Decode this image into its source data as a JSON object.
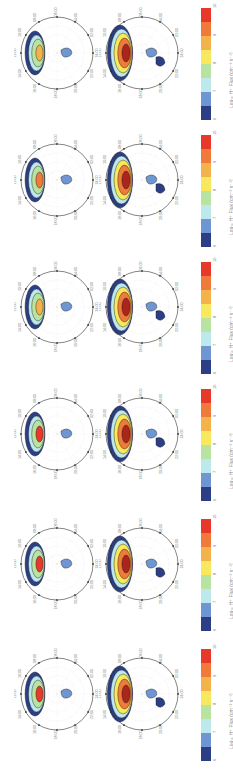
{
  "figure": {
    "orientation": "rotated 90 degrees (text reads bottom-to-top)",
    "panel_rows": 6,
    "plots_per_row": 2
  },
  "colorbar": {
    "label": "Log₁₀ H⁺ Flux (cm⁻² s⁻¹)",
    "ticks": [
      "6",
      "7",
      "8",
      "9",
      "10"
    ],
    "colors": [
      "#e8382a",
      "#f07a3a",
      "#f3b24a",
      "#f7e85e",
      "#b9e3a0",
      "#bde8ec",
      "#6e96d2",
      "#2c3f86"
    ]
  },
  "polar_axis": {
    "mlt_labels": [
      "12:00",
      "10:00",
      "08:00",
      "06:00",
      "04:00",
      "02:00",
      "24:00",
      "22:00",
      "20:00",
      "18:00",
      "16:00",
      "14:00"
    ]
  },
  "chart_data": {
    "type": "heatmap",
    "title": "",
    "colorbar": {
      "label": "Log10 H+ Flux (cm^-2 s^-1)",
      "range": [
        6,
        10
      ],
      "ticks": [
        6,
        7,
        8,
        9,
        10
      ],
      "levels": [
        6,
        6.5,
        7,
        7.5,
        8,
        8.5,
        9,
        9.5,
        10
      ]
    },
    "angular_axis": {
      "labels": [
        "12:00",
        "14:00",
        "16:00",
        "18:00",
        "20:00",
        "22:00",
        "24:00",
        "02:00",
        "04:00",
        "06:00",
        "08:00",
        "10:00"
      ]
    },
    "panels": [
      {
        "row": 1,
        "col": 1,
        "peak_level": 8.5,
        "dominant_sector": "12:00-14:00",
        "note": "narrow arc, green/yellow, small blue patch near center"
      },
      {
        "row": 1,
        "col": 2,
        "peak_level": 10,
        "dominant_sector": "12:00-16:00",
        "note": "large red region with blue extension toward 24:00"
      },
      {
        "row": 2,
        "col": 1,
        "peak_level": 9,
        "dominant_sector": "12:00-14:00",
        "note": "arc with orange core"
      },
      {
        "row": 2,
        "col": 2,
        "peak_level": 10,
        "dominant_sector": "12:00-14:00",
        "note": "red core, brown/blue streamers toward night side"
      },
      {
        "row": 3,
        "col": 1,
        "peak_level": 8.5,
        "dominant_sector": "10:00-14:00",
        "note": "yellow/green arc"
      },
      {
        "row": 3,
        "col": 2,
        "peak_level": 10,
        "dominant_sector": "12:00-14:00",
        "note": "red/orange arc, blue patches night side"
      },
      {
        "row": 4,
        "col": 1,
        "peak_level": 9.5,
        "dominant_sector": "12:00-14:00",
        "note": "red core with yellow/green surround"
      },
      {
        "row": 4,
        "col": 2,
        "peak_level": 10,
        "dominant_sector": "12:00-14:00",
        "note": "red core, blue extension to 24:00"
      },
      {
        "row": 5,
        "col": 1,
        "peak_level": 9.5,
        "dominant_sector": "12:00-14:00",
        "note": "red/orange core arc"
      },
      {
        "row": 5,
        "col": 2,
        "peak_level": 10,
        "dominant_sector": "12:00-14:00",
        "note": "red/orange core, blue patches"
      },
      {
        "row": 6,
        "col": 1,
        "peak_level": 9.5,
        "dominant_sector": "10:00-14:00",
        "note": "red core, yellow band toward 06:00-04:00"
      },
      {
        "row": 6,
        "col": 2,
        "peak_level": 10,
        "dominant_sector": "12:00-14:00",
        "note": "red core with blue arm"
      }
    ]
  }
}
